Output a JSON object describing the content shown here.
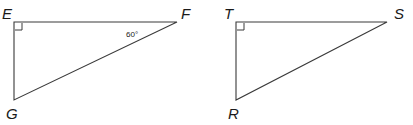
{
  "figure": {
    "background_color": "#ffffff",
    "line_color": "#3a3a3a",
    "text_color": "#1a1a1a",
    "triangles": [
      {
        "id": "efg",
        "name": "triangle-efg",
        "vertices": [
          {
            "label": "E",
            "x": 14,
            "y": 22,
            "label_x": 2,
            "label_y": 19
          },
          {
            "label": "F",
            "x": 177,
            "y": 22,
            "label_x": 181,
            "label_y": 19
          },
          {
            "label": "G",
            "x": 14,
            "y": 100,
            "label_x": 6,
            "label_y": 119
          }
        ],
        "right_angle_at": "E",
        "right_angle_marker": {
          "x": 15,
          "y": 23,
          "size": 7
        },
        "angle_annotation": {
          "text": "60°",
          "at_vertex": "F",
          "x": 126,
          "y": 37
        }
      },
      {
        "id": "tsr",
        "name": "triangle-tsr",
        "vertices": [
          {
            "label": "T",
            "x": 236,
            "y": 22,
            "label_x": 224,
            "label_y": 19
          },
          {
            "label": "S",
            "x": 387,
            "y": 22,
            "label_x": 394,
            "label_y": 19
          },
          {
            "label": "R",
            "x": 236,
            "y": 100,
            "label_x": 228,
            "label_y": 119
          }
        ],
        "right_angle_at": "T",
        "right_angle_marker": {
          "x": 237,
          "y": 23,
          "size": 7
        },
        "angle_annotation": null
      }
    ]
  }
}
